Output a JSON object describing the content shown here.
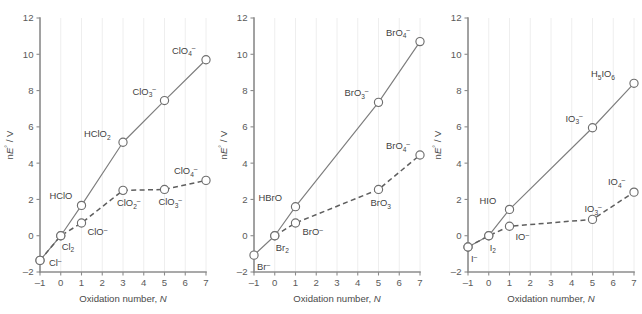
{
  "figure": {
    "panel_count": 3,
    "axis": {
      "xlabel_prefix": "Oxidation number, ",
      "xlabel_symbol": "N",
      "ylabel_prefix": "n",
      "ylabel_symbol": "E",
      "ylabel_degree": "°",
      "ylabel_suffix": " / V",
      "ylabel_full": "nE° / V",
      "xticks": [
        -1,
        0,
        1,
        2,
        3,
        4,
        5,
        6,
        7
      ],
      "xtick_labels": [
        "–1",
        "0",
        "1",
        "2",
        "3",
        "4",
        "5",
        "6",
        "7"
      ],
      "yticks": [
        -2,
        0,
        2,
        4,
        6,
        8,
        10,
        12
      ],
      "ytick_labels": [
        "–2",
        "0",
        "2",
        "4",
        "6",
        "8",
        "10",
        "12"
      ],
      "xlim": [
        -1,
        7
      ],
      "ylim": [
        -2,
        12
      ],
      "grid": "vertical-light"
    },
    "colors": {
      "axis": "#8c8c8c",
      "grid": "#eeeeee",
      "solid_series": "#7d7d7d",
      "dashed_series": "#5e5e5e",
      "marker_fill": "#ffffff",
      "text": "#4a4a4a",
      "background": "#ffffff"
    },
    "panels": [
      {
        "id": "chlorine",
        "element": "Cl",
        "series": [
          {
            "name": "acidic",
            "style": "solid",
            "points": [
              {
                "x": -1,
                "y": -1.36,
                "label_main": "Cl",
                "label_sup": "–",
                "label_sub": "",
                "label_dx": 9,
                "label_dy": 6
              },
              {
                "x": 0,
                "y": 0.0,
                "label_main": "Cl",
                "label_sup": "",
                "label_sub": "2",
                "label_dx": 1,
                "label_dy": 14
              },
              {
                "x": 1,
                "y": 1.67,
                "label_main": "HClO",
                "label_sup": "",
                "label_sub": "",
                "label_dx": -32,
                "label_dy": -6
              },
              {
                "x": 3,
                "y": 5.15,
                "label_main": "HClO",
                "label_sup": "",
                "label_sub": "2",
                "label_dx": -39,
                "label_dy": -5
              },
              {
                "x": 5,
                "y": 7.45,
                "label_main": "ClO",
                "label_sup": "–",
                "label_sub": "3",
                "label_dx": -32,
                "label_dy": -6
              },
              {
                "x": 7,
                "y": 9.7,
                "label_main": "ClO",
                "label_sup": "–",
                "label_sub": "4",
                "label_dx": -34,
                "label_dy": -6
              }
            ]
          },
          {
            "name": "basic",
            "style": "dashed",
            "points": [
              {
                "x": -1,
                "y": -1.36,
                "label_main": "",
                "label_sup": "",
                "label_sub": "",
                "label_dx": 0,
                "label_dy": 0
              },
              {
                "x": 0,
                "y": 0.0,
                "label_main": "",
                "label_sup": "",
                "label_sub": "",
                "label_dx": 0,
                "label_dy": 0
              },
              {
                "x": 1,
                "y": 0.7,
                "label_main": "ClO",
                "label_sup": "–",
                "label_sub": "",
                "label_dx": 6,
                "label_dy": 12
              },
              {
                "x": 3,
                "y": 2.5,
                "label_main": "ClO",
                "label_sup": "–",
                "label_sub": "2",
                "label_dx": -6,
                "label_dy": 16
              },
              {
                "x": 5,
                "y": 2.55,
                "label_main": "ClO",
                "label_sup": "–",
                "label_sub": "3",
                "label_dx": -6,
                "label_dy": 16
              },
              {
                "x": 7,
                "y": 3.05,
                "label_main": "ClO",
                "label_sup": "–",
                "label_sub": "4",
                "label_dx": -32,
                "label_dy": -6
              }
            ]
          }
        ]
      },
      {
        "id": "bromine",
        "element": "Br",
        "series": [
          {
            "name": "acidic",
            "style": "solid",
            "points": [
              {
                "x": -1,
                "y": -1.07,
                "label_main": "Br",
                "label_sup": "–",
                "label_sub": "",
                "label_dx": 3,
                "label_dy": 15
              },
              {
                "x": 0,
                "y": 0.0,
                "label_main": "Br",
                "label_sup": "",
                "label_sub": "2",
                "label_dx": 1,
                "label_dy": 15
              },
              {
                "x": 1,
                "y": 1.6,
                "label_main": "HBrO",
                "label_sup": "",
                "label_sub": "",
                "label_dx": -37,
                "label_dy": -6
              },
              {
                "x": 5,
                "y": 7.35,
                "label_main": "BrO",
                "label_sup": "–",
                "label_sub": "3",
                "label_dx": -34,
                "label_dy": -6
              },
              {
                "x": 7,
                "y": 10.7,
                "label_main": "BrO",
                "label_sup": "–",
                "label_sub": "4",
                "label_dx": -34,
                "label_dy": -6
              }
            ]
          },
          {
            "name": "basic",
            "style": "dashed",
            "points": [
              {
                "x": 0,
                "y": 0.0,
                "label_main": "",
                "label_sup": "",
                "label_sub": "",
                "label_dx": 0,
                "label_dy": 0
              },
              {
                "x": 1,
                "y": 0.7,
                "label_main": "BrO",
                "label_sup": "–",
                "label_sub": "",
                "label_dx": 7,
                "label_dy": 12
              },
              {
                "x": 5,
                "y": 2.55,
                "label_main": "BrO",
                "label_sup": "",
                "label_sub": "3",
                "label_dx": -8,
                "label_dy": 17
              },
              {
                "x": 7,
                "y": 4.45,
                "label_main": "BrO",
                "label_sup": "–",
                "label_sub": "4",
                "label_dx": -34,
                "label_dy": -6
              }
            ]
          }
        ]
      },
      {
        "id": "iodine",
        "element": "I",
        "series": [
          {
            "name": "acidic",
            "style": "solid",
            "points": [
              {
                "x": -1,
                "y": -0.62,
                "label_main": "I",
                "label_sup": "–",
                "label_sub": "",
                "label_dx": 3,
                "label_dy": 15
              },
              {
                "x": 0,
                "y": 0.0,
                "label_main": "I",
                "label_sup": "",
                "label_sub": "2",
                "label_dx": 1,
                "label_dy": 15
              },
              {
                "x": 1,
                "y": 1.45,
                "label_main": "HIO",
                "label_sup": "",
                "label_sub": "",
                "label_dx": -30,
                "label_dy": -5
              },
              {
                "x": 5,
                "y": 5.95,
                "label_main": "IO",
                "label_sup": "–",
                "label_sub": "3",
                "label_dx": -27,
                "label_dy": -6
              },
              {
                "x": 7,
                "y": 8.4,
                "label_main": "H",
                "label_sup": "",
                "label_sub": "5",
                "label_dx": -43,
                "label_dy": -6,
                "label_tail": "IO",
                "label_tail_sub": "6"
              }
            ]
          },
          {
            "name": "basic",
            "style": "dashed",
            "points": [
              {
                "x": -1,
                "y": -0.62,
                "label_main": "",
                "label_sup": "",
                "label_sub": "",
                "label_dx": 0,
                "label_dy": 0
              },
              {
                "x": 0,
                "y": 0.0,
                "label_main": "",
                "label_sup": "",
                "label_sub": "",
                "label_dx": 0,
                "label_dy": 0
              },
              {
                "x": 1,
                "y": 0.52,
                "label_main": "IO",
                "label_sup": "–",
                "label_sub": "",
                "label_dx": 6,
                "label_dy": 14
              },
              {
                "x": 5,
                "y": 0.9,
                "label_main": "IO",
                "label_sup": "–",
                "label_sub": "3",
                "label_dx": -8,
                "label_dy": -7
              },
              {
                "x": 7,
                "y": 2.4,
                "label_main": "IO",
                "label_sup": "–",
                "label_sub": "4",
                "label_dx": -26,
                "label_dy": -7
              }
            ]
          }
        ]
      }
    ]
  },
  "chart_data": {
    "type": "line",
    "title": "",
    "xlabel": "Oxidation number, N",
    "ylabel": "nE° / V",
    "xlim": [
      -1,
      7
    ],
    "ylim": [
      -2,
      12
    ],
    "xticks": [
      -1,
      0,
      1,
      2,
      3,
      4,
      5,
      6,
      7
    ],
    "yticks": [
      -2,
      0,
      2,
      4,
      6,
      8,
      10,
      12
    ],
    "grid": "vertical only, light gray",
    "legend": "none",
    "panels": [
      {
        "name": "Chlorine Frost diagram",
        "series": [
          {
            "name": "acidic solution (solid line)",
            "style": "solid",
            "x": [
              -1,
              0,
              1,
              3,
              5,
              7
            ],
            "y": [
              -1.36,
              0.0,
              1.67,
              5.15,
              7.45,
              9.7
            ],
            "labels": [
              "Cl–",
              "Cl2",
              "HClO",
              "HClO2",
              "ClO3–",
              "ClO4–"
            ]
          },
          {
            "name": "basic solution (dashed line)",
            "style": "dashed",
            "x": [
              -1,
              0,
              1,
              3,
              5,
              7
            ],
            "y": [
              -1.36,
              0.0,
              0.7,
              2.5,
              2.55,
              3.05
            ],
            "labels": [
              "Cl–",
              "Cl2",
              "ClO–",
              "ClO2–",
              "ClO3–",
              "ClO4–"
            ]
          }
        ]
      },
      {
        "name": "Bromine Frost diagram",
        "series": [
          {
            "name": "acidic solution (solid line)",
            "style": "solid",
            "x": [
              -1,
              0,
              1,
              5,
              7
            ],
            "y": [
              -1.07,
              0.0,
              1.6,
              7.35,
              10.7
            ],
            "labels": [
              "Br–",
              "Br2",
              "HBrO",
              "BrO3–",
              "BrO4–"
            ]
          },
          {
            "name": "basic solution (dashed line)",
            "style": "dashed",
            "x": [
              0,
              1,
              5,
              7
            ],
            "y": [
              0.0,
              0.7,
              2.55,
              4.45
            ],
            "labels": [
              "Br2",
              "BrO–",
              "BrO3",
              "BrO4–"
            ]
          }
        ]
      },
      {
        "name": "Iodine Frost diagram",
        "series": [
          {
            "name": "acidic solution (solid line)",
            "style": "solid",
            "x": [
              -1,
              0,
              1,
              5,
              7
            ],
            "y": [
              -0.62,
              0.0,
              1.45,
              5.95,
              8.4
            ],
            "labels": [
              "I–",
              "I2",
              "HIO",
              "IO3–",
              "H5IO6"
            ]
          },
          {
            "name": "basic solution (dashed line)",
            "style": "dashed",
            "x": [
              -1,
              0,
              1,
              5,
              7
            ],
            "y": [
              -0.62,
              0.0,
              0.52,
              0.9,
              2.4
            ],
            "labels": [
              "I–",
              "I2",
              "IO–",
              "IO3–",
              "IO4–"
            ]
          }
        ]
      }
    ]
  }
}
